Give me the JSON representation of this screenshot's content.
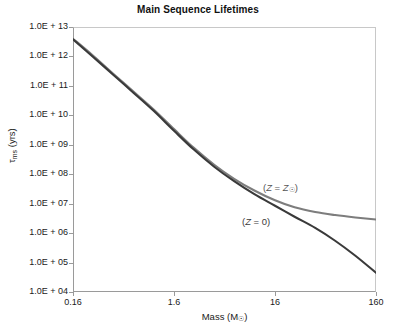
{
  "chart_data": {
    "type": "line",
    "title": "Main Sequence Lifetimes",
    "xlabel": "Mass (M☉)",
    "ylabel": "τms (yrs)",
    "xscale": "log",
    "yscale": "log",
    "xlim": [
      0.16,
      160
    ],
    "ylim": [
      10000,
      10000000000000
    ],
    "grid": false,
    "legend_position": "inline-annotations",
    "x_tick_labels": [
      "0.16",
      "1.6",
      "16",
      "160"
    ],
    "x_tick_values": [
      0.16,
      1.6,
      16,
      160
    ],
    "y_tick_labels": [
      "1.0E + 13",
      "1.0E + 12",
      "1.0E + 11",
      "1.0E + 10",
      "1.0E + 09",
      "1.0E + 08",
      "1.0E + 07",
      "1.0E + 06",
      "1.0E + 05",
      "1.0E + 04"
    ],
    "y_tick_values": [
      10000000000000.0,
      1000000000000.0,
      100000000000.0,
      10000000000.0,
      1000000000.0,
      100000000.0,
      10000000.0,
      1000000.0,
      100000.0,
      10000.0
    ],
    "series": [
      {
        "name": "(Z = Z☉)",
        "color": "#7d7d7d",
        "annotation": "(Z = Z☉)",
        "x": [
          0.16,
          0.25,
          0.4,
          0.63,
          1.0,
          1.6,
          2.5,
          4.0,
          6.3,
          10.0,
          16.0,
          25.0,
          40.0,
          63.0,
          100.0,
          160.0
        ],
        "y": [
          4000000000000.0,
          1100000000000.0,
          260000000000.0,
          65000000000.0,
          16000000000.0,
          3400000000.0,
          800000000.0,
          210000000.0,
          70000000.0,
          28000000.0,
          13000000.0,
          7500000.0,
          5200000.0,
          4100000.0,
          3400000.0,
          2900000.0
        ]
      },
      {
        "name": "(Z = 0)",
        "color": "#3a3a3a",
        "annotation": "(Z = 0)",
        "x": [
          0.16,
          0.25,
          0.4,
          0.63,
          1.0,
          1.6,
          2.5,
          4.0,
          6.3,
          10.0,
          16.0,
          25.0,
          40.0,
          63.0,
          100.0,
          160.0
        ],
        "y": [
          3800000000000.0,
          1000000000000.0,
          240000000000.0,
          60000000000.0,
          14500000000.0,
          3000000000.0,
          700000000.0,
          180000000.0,
          58000000.0,
          21000000.0,
          8500000.0,
          3600000.0,
          1500000.0,
          550000.0,
          170000.0,
          45000.0
        ]
      }
    ]
  },
  "axes": {
    "x_title": "Mass (M",
    "x_title_sub": "☉",
    "x_title_end": ")",
    "y_title_main": "τ",
    "y_title_sub": "ms",
    "y_title_end": " (yrs)"
  },
  "annotations": {
    "z_solar_open": "(",
    "z_solar_var": "Z",
    "z_solar_eq": " = ",
    "z_solar_val": "Z",
    "z_solar_sub": "☉",
    "z_solar_close": ")",
    "z_zero_open": "(",
    "z_zero_var": "Z",
    "z_zero_rest": " = 0)"
  },
  "colors": {
    "solar_curve": "#7d7d7d",
    "zero_curve": "#3a3a3a",
    "axis": "#9a9a9a",
    "text": "#1a1a1a"
  }
}
